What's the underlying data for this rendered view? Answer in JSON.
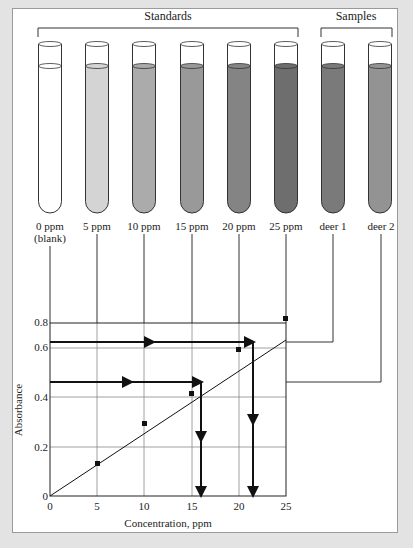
{
  "figure": {
    "groups": [
      {
        "label": "Standards"
      },
      {
        "label": "Samples"
      }
    ],
    "tubes": [
      {
        "label": "0 ppm",
        "sublabel": "(blank)",
        "color": "#ffffff"
      },
      {
        "label": "5 ppm",
        "sublabel": "",
        "color": "#d4d4d4"
      },
      {
        "label": "10 ppm",
        "sublabel": "",
        "color": "#ababab"
      },
      {
        "label": "15 ppm",
        "sublabel": "",
        "color": "#999999"
      },
      {
        "label": "20 ppm",
        "sublabel": "",
        "color": "#848484"
      },
      {
        "label": "25 ppm",
        "sublabel": "",
        "color": "#6e6e6e"
      },
      {
        "label": "deer 1",
        "sublabel": "",
        "color": "#7a7a7a"
      },
      {
        "label": "deer 2",
        "sublabel": "",
        "color": "#939393"
      }
    ]
  },
  "chart_data": {
    "type": "scatter",
    "title": "",
    "xlabel": "Concentration, ppm",
    "ylabel": "Absorbance",
    "xlim": [
      0,
      25
    ],
    "ylim": [
      0,
      0.8
    ],
    "xticks": [
      "0",
      "5",
      "10",
      "15",
      "20",
      "25"
    ],
    "yticks": [
      "0",
      "0.2",
      "0.4",
      "0.6",
      "0.8"
    ],
    "grid": true,
    "series": [
      {
        "name": "Standards",
        "x": [
          0,
          5,
          10,
          15,
          20,
          25
        ],
        "y": [
          0,
          0.13,
          0.29,
          0.42,
          0.58,
          0.72
        ]
      }
    ],
    "fit_line": {
      "x": [
        0,
        25
      ],
      "y": [
        0,
        0.72
      ]
    },
    "samples": [
      {
        "name": "deer 1",
        "absorbance": 0.62,
        "concentration": 21.5
      },
      {
        "name": "deer 2",
        "absorbance": 0.46,
        "concentration": 16
      }
    ]
  }
}
